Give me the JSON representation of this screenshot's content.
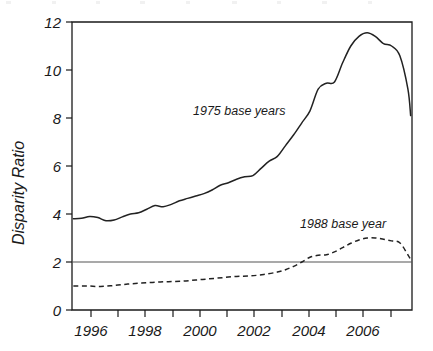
{
  "chart_data": {
    "type": "line",
    "title": "",
    "xlabel": "",
    "ylabel": "Disparity Ratio",
    "xlim": [
      1995.25,
      2007.75
    ],
    "ylim": [
      0,
      12
    ],
    "yticks": [
      0,
      2,
      4,
      6,
      8,
      10,
      12
    ],
    "ytick_labels": [
      "0",
      "2",
      "4",
      "6",
      "8",
      "10",
      "12"
    ],
    "xticks": [
      1996,
      1997,
      1998,
      1999,
      2000,
      2001,
      2002,
      2003,
      2004,
      2005,
      2006,
      2007
    ],
    "xtick_labels": [
      "1996",
      "",
      "1998",
      "",
      "2000",
      "",
      "2002",
      "",
      "2004",
      "",
      "2006",
      ""
    ],
    "grid": false,
    "legend_position": "inline-annotations",
    "reference_lines": [
      {
        "name": "ratio-of-two",
        "axis": "y",
        "value": 2,
        "style": "solid",
        "color": "#555555"
      }
    ],
    "annotations": [
      {
        "text": "1975 base years",
        "x": 2000.45,
        "y": 8.3
      },
      {
        "text": "1988 base year",
        "x": 2005.05,
        "y": 3.6
      }
    ],
    "series": [
      {
        "name": "1975 base years",
        "style": "solid",
        "color": "#222222",
        "x": [
          1995.3,
          1995.6,
          1995.9,
          1996.2,
          1996.5,
          1996.8,
          1997.1,
          1997.4,
          1997.7,
          1998.0,
          1998.3,
          1998.6,
          1998.9,
          1999.2,
          1999.5,
          1999.8,
          2000.1,
          2000.4,
          2000.7,
          2001.0,
          2001.3,
          2001.6,
          2001.9,
          2002.2,
          2002.5,
          2002.8,
          2003.1,
          2003.4,
          2003.7,
          2004.0,
          2004.3,
          2004.6,
          2004.9,
          2005.2,
          2005.5,
          2005.8,
          2006.1,
          2006.4,
          2006.7,
          2007.0,
          2007.3,
          2007.6,
          2007.7
        ],
        "values": [
          3.8,
          3.82,
          3.9,
          3.85,
          3.72,
          3.75,
          3.88,
          4.0,
          4.05,
          4.2,
          4.35,
          4.3,
          4.4,
          4.55,
          4.65,
          4.75,
          4.85,
          5.0,
          5.2,
          5.3,
          5.45,
          5.55,
          5.6,
          5.9,
          6.2,
          6.4,
          6.85,
          7.3,
          7.8,
          8.3,
          9.2,
          9.45,
          9.5,
          10.3,
          11.0,
          11.4,
          11.55,
          11.4,
          11.1,
          11.0,
          10.6,
          9.2,
          8.1
        ]
      },
      {
        "name": "1988 base year",
        "style": "dashed",
        "color": "#222222",
        "x": [
          1995.3,
          1995.8,
          1996.3,
          1996.8,
          1997.3,
          1997.8,
          1998.3,
          1998.8,
          1999.3,
          1999.8,
          2000.3,
          2000.8,
          2001.3,
          2001.8,
          2002.3,
          2002.8,
          2003.1,
          2003.4,
          2003.7,
          2004.0,
          2004.3,
          2004.6,
          2004.9,
          2005.2,
          2005.5,
          2005.8,
          2006.1,
          2006.4,
          2006.7,
          2007.0,
          2007.3,
          2007.6,
          2007.7
        ],
        "values": [
          1.0,
          1.0,
          0.98,
          1.02,
          1.08,
          1.12,
          1.16,
          1.18,
          1.2,
          1.25,
          1.3,
          1.35,
          1.4,
          1.42,
          1.48,
          1.58,
          1.68,
          1.82,
          2.0,
          2.2,
          2.28,
          2.3,
          2.42,
          2.6,
          2.78,
          2.92,
          3.0,
          3.0,
          2.95,
          2.88,
          2.8,
          2.3,
          2.1
        ]
      }
    ]
  },
  "axes": {
    "ylabel": "Disparity Ratio"
  }
}
